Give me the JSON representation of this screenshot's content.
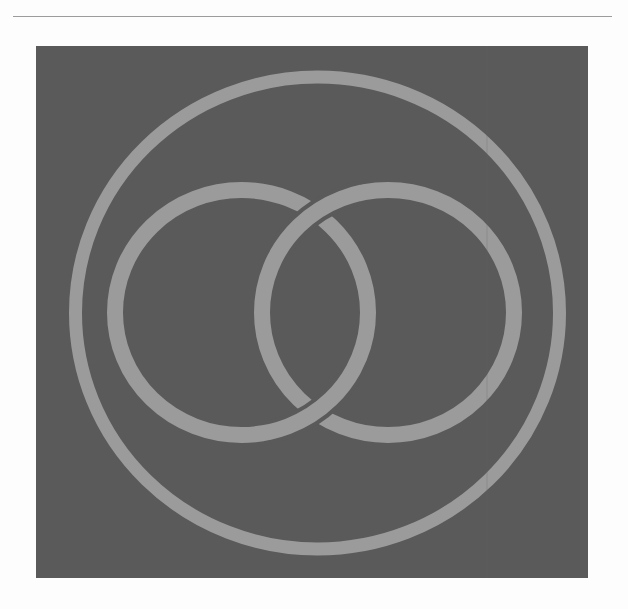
{
  "page": {
    "rule": {
      "color": "#9c9c9c"
    }
  },
  "figure": {
    "background_color": "#5a5a5a",
    "ring_color": "#9b9b9b",
    "shapes": [
      {
        "name": "outer-ring",
        "cx": 317.5,
        "cy": 313,
        "rx": 242,
        "ry": 236,
        "stroke_width": 13
      },
      {
        "name": "left-ring",
        "cx": 241.5,
        "cy": 312.5,
        "rx": 126.5,
        "ry": 122.5,
        "stroke_width": 16
      },
      {
        "name": "right-ring",
        "cx": 388,
        "cy": 312.5,
        "rx": 126,
        "ry": 122.5,
        "stroke_width": 16
      }
    ],
    "interlock": {
      "top_crossing": "right-ring over left-ring",
      "bottom_crossing": "left-ring over right-ring"
    }
  }
}
